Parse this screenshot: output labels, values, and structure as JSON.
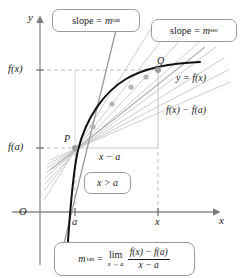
{
  "figure": {
    "background_color": "#ffffff",
    "curve_color": "#111111",
    "secant_color": "#b9b9b9",
    "tangent_color": "#8c8c8c",
    "axis_color": "#8a8a8a",
    "guide_color": "#bdbdbd",
    "point_color": "#b0b0b0",
    "text_color": "#1a1a1a"
  },
  "axes": {
    "y_axis_label": "y",
    "x_axis_label": "x",
    "origin_label": "O",
    "y_ticks": [
      {
        "label_main": "f",
        "label_arg": "(x)",
        "text": "f(x)"
      },
      {
        "label_main": "f",
        "label_arg": "(a)",
        "text": "f(a)"
      }
    ],
    "x_ticks": [
      {
        "text": "a"
      },
      {
        "text": "x"
      }
    ]
  },
  "points": [
    {
      "name": "P",
      "label": "P"
    },
    {
      "name": "Q",
      "label": "Q"
    }
  ],
  "curve": {
    "label_y": "y",
    "label_eq": "=",
    "label_fx": "f(x)",
    "label": "y = f(x)"
  },
  "callouts": {
    "tangent_slope": {
      "lead": "slope",
      "equals": "=",
      "symbol": "m",
      "subscript": "tan",
      "text": "slope = m tan"
    },
    "secant_slope": {
      "lead": "slope",
      "equals": "=",
      "symbol": "m",
      "subscript": "sec",
      "text": "slope = m sec"
    },
    "inequality": {
      "left": "x",
      "op": ">",
      "right": "a",
      "text": "x > a"
    },
    "formula": {
      "lhs_symbol": "m",
      "lhs_subscript": "tan",
      "equals": "=",
      "limit_operator": "lim",
      "limit_subscript": "x → a",
      "numerator": "f(x) − f(a)",
      "denominator": "x − a",
      "text": "m tan = lim (x→a) [ f(x) − f(a) ] / ( x − a )"
    }
  },
  "annotations": {
    "rise_label": "f(x) − f(a)",
    "run_label": "x − a"
  }
}
